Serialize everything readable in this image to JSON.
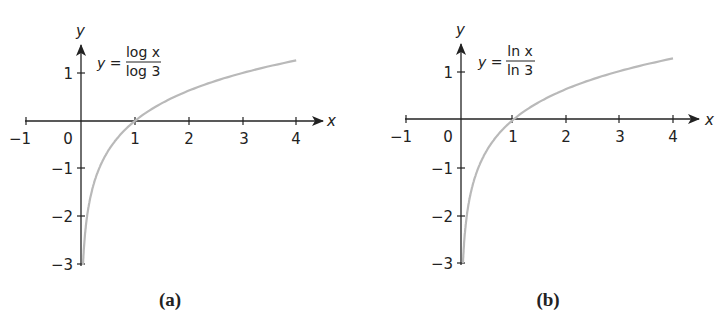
{
  "chart_data": [
    {
      "type": "line",
      "panel": "a",
      "caption": "(a)",
      "equation": {
        "lhs": "y =",
        "numerator": "log x",
        "denominator": "log 3"
      },
      "xlabel": "x",
      "ylabel": "y",
      "x_ticks": [
        "−1",
        "0",
        "1",
        "2",
        "3",
        "4"
      ],
      "y_ticks": [
        "1",
        "−1",
        "−2",
        "−3"
      ],
      "xlim": [
        -1,
        4
      ],
      "ylim": [
        -3,
        1.3
      ],
      "grid": false,
      "series": [
        {
          "name": "y = log x / log 3",
          "x": [
            0.037,
            0.05,
            0.1,
            0.2,
            0.3,
            0.5,
            0.75,
            1,
            1.5,
            2,
            2.5,
            3,
            3.5,
            4
          ],
          "y": [
            -3.0,
            -2.73,
            -2.1,
            -1.46,
            -1.1,
            -0.63,
            -0.26,
            0,
            0.37,
            0.63,
            0.83,
            1.0,
            1.14,
            1.26
          ]
        }
      ],
      "color": "#b9b9b9"
    },
    {
      "type": "line",
      "panel": "b",
      "caption": "(b)",
      "equation": {
        "lhs": "y =",
        "numerator": "ln x",
        "denominator": "ln 3"
      },
      "xlabel": "x",
      "ylabel": "y",
      "x_ticks": [
        "−1",
        "0",
        "1",
        "2",
        "3",
        "4"
      ],
      "y_ticks": [
        "1",
        "−1",
        "−2",
        "−3"
      ],
      "xlim": [
        -1,
        4
      ],
      "ylim": [
        -3,
        1.3
      ],
      "grid": false,
      "series": [
        {
          "name": "y = ln x / ln 3",
          "x": [
            0.037,
            0.05,
            0.1,
            0.2,
            0.3,
            0.5,
            0.75,
            1,
            1.5,
            2,
            2.5,
            3,
            3.5,
            4
          ],
          "y": [
            -3.0,
            -2.73,
            -2.1,
            -1.46,
            -1.1,
            -0.63,
            -0.26,
            0,
            0.37,
            0.63,
            0.83,
            1.0,
            1.14,
            1.26
          ]
        }
      ],
      "color": "#b9b9b9"
    }
  ]
}
